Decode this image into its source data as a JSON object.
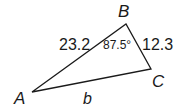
{
  "diagram": {
    "type": "triangle",
    "vertices": {
      "A": {
        "label": "A",
        "x": 32,
        "y": 92
      },
      "B": {
        "label": "B",
        "x": 126,
        "y": 24
      },
      "C": {
        "label": "C",
        "x": 151,
        "y": 69
      }
    },
    "sides": {
      "AB": "23.2",
      "BC": "12.3",
      "AC": "b"
    },
    "angles": {
      "B": "87.5°"
    },
    "stroke_color": "#1a1a1a"
  }
}
